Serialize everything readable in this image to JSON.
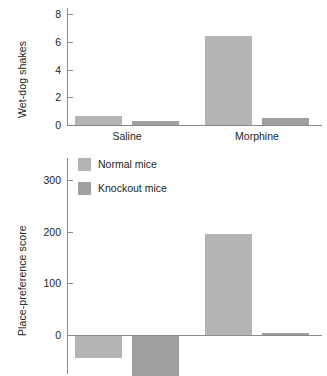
{
  "figure": {
    "background": "#ffffff",
    "bar_color_normal": "#b4b4b4",
    "bar_color_knockout": "#a0a0a0",
    "axis_color": "#8a8a8a"
  },
  "legend": {
    "position": "top-left-of-lower-panel",
    "entries": [
      {
        "label": "Normal mice",
        "color": "#b4b4b4",
        "key": "normal"
      },
      {
        "label": "Knockout mice",
        "color": "#a0a0a0",
        "key": "knockout"
      }
    ]
  },
  "chart_data": [
    {
      "id": "wet-dog-shakes",
      "type": "bar",
      "title": "",
      "xlabel": "",
      "ylabel": "Wet-dog shakes",
      "categories": [
        "Saline",
        "Morphine"
      ],
      "ylim": [
        0,
        8.6
      ],
      "yticks": [
        0,
        2,
        4,
        6,
        8
      ],
      "yticklabels": [
        "0",
        "2",
        "4",
        "6",
        "8"
      ],
      "grid": false,
      "legend": "none",
      "series": [
        {
          "name": "Normal mice",
          "key": "normal",
          "values": [
            0.65,
            6.4
          ]
        },
        {
          "name": "Knockout mice",
          "key": "knockout",
          "values": [
            0.3,
            0.5
          ]
        }
      ]
    },
    {
      "id": "place-preference-score",
      "type": "bar",
      "title": "",
      "xlabel": "",
      "ylabel": "Place-preference score",
      "categories": [
        "Saline",
        "Morphine"
      ],
      "ylim": [
        -90,
        340
      ],
      "yticks": [
        0,
        100,
        200,
        300
      ],
      "yticklabels": [
        "0",
        "100",
        "200",
        "300"
      ],
      "grid": false,
      "legend": "upper-left",
      "series": [
        {
          "name": "Normal mice",
          "key": "normal",
          "values": [
            -42,
            195
          ]
        },
        {
          "name": "Knockout mice",
          "key": "knockout",
          "values": [
            -78,
            4
          ]
        }
      ]
    }
  ]
}
